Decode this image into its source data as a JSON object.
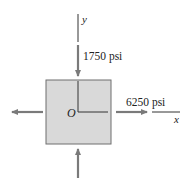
{
  "diagram": {
    "type": "stress-element",
    "element": {
      "fill": "#d9d9d9",
      "stroke": "#6f6f6f"
    },
    "arrow_color": "#7a7a7a",
    "axis_color": "#333333",
    "origin_label": "O",
    "x_axis_label": "x",
    "y_axis_label": "y",
    "stresses": [
      {
        "id": "normal-y",
        "direction": "compressive",
        "axis": "y",
        "label": "1750 psi"
      },
      {
        "id": "normal-x",
        "direction": "tensile",
        "axis": "x",
        "label": "6250 psi"
      }
    ]
  }
}
